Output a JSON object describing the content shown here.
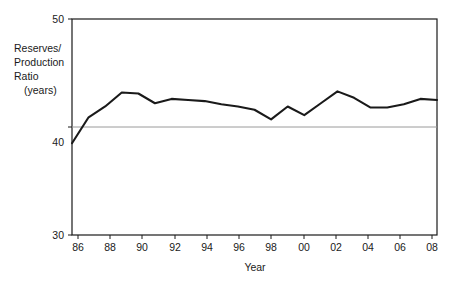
{
  "chart_data": {
    "type": "line",
    "title": "",
    "xlabel": "Year",
    "ylabel": "Reserves/\nProduction\nRatio\n(years)",
    "ylabel_lines": [
      "Reserves/",
      "Production",
      "Ratio",
      "(years)"
    ],
    "xlim": [
      1986,
      2008
    ],
    "ylim": [
      30,
      50
    ],
    "grid": false,
    "legend": "none",
    "xtick_labels": [
      "86",
      "88",
      "90",
      "92",
      "94",
      "96",
      "98",
      "00",
      "02",
      "04",
      "06",
      "08"
    ],
    "xtick_values": [
      1986,
      1988,
      1990,
      1992,
      1994,
      1996,
      1998,
      2000,
      2002,
      2004,
      2006,
      2008
    ],
    "ytick_labels": [
      "50",
      "40",
      "30"
    ],
    "ytick_values": [
      50,
      40,
      30
    ],
    "reference_line": {
      "value": 41.0,
      "orientation": "horizontal",
      "color": "#8c8c8c"
    },
    "line_color": "#1a1a1a",
    "x": [
      1986,
      1987,
      1988,
      1989,
      1990,
      1991,
      1992,
      1993,
      1994,
      1995,
      1996,
      1997,
      1998,
      1999,
      2000,
      2001,
      2002,
      2003,
      2004,
      2005,
      2006,
      2007,
      2008
    ],
    "values": [
      38.5,
      40.9,
      41.9,
      43.2,
      43.1,
      42.2,
      42.6,
      42.5,
      42.4,
      42.1,
      41.9,
      41.6,
      40.7,
      41.9,
      41.1,
      42.2,
      43.3,
      42.7,
      41.8,
      41.8,
      42.1,
      42.6,
      42.5
    ],
    "series": [
      {
        "name": "Reserves/Production Ratio",
        "values": [
          38.5,
          40.9,
          41.9,
          43.2,
          43.1,
          42.2,
          42.6,
          42.5,
          42.4,
          42.1,
          41.9,
          41.6,
          40.7,
          41.9,
          41.1,
          42.2,
          43.3,
          42.7,
          41.8,
          41.8,
          42.1,
          42.6,
          42.5
        ]
      }
    ]
  }
}
